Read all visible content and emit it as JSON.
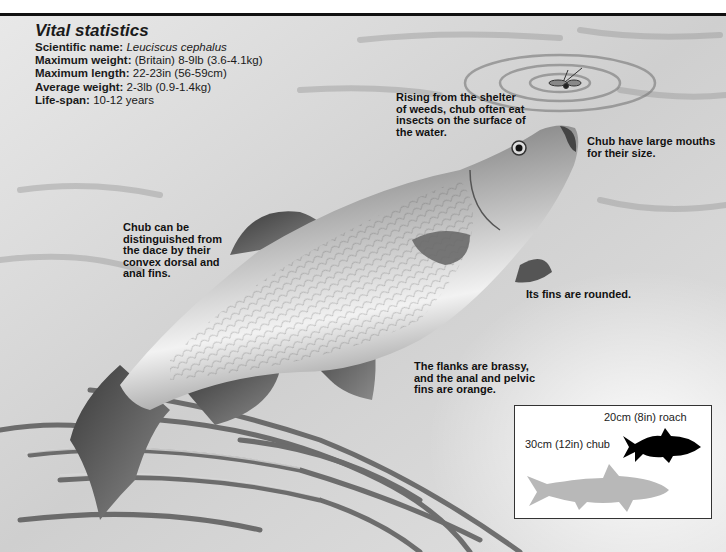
{
  "vital_statistics": {
    "title": "Vital statistics",
    "rows": [
      {
        "label": "Scientific name:",
        "value": "Leuciscus cephalus",
        "italic": true
      },
      {
        "label": "Maximum weight:",
        "value": "(Britain) 8-9lb (3.6-4.1kg)"
      },
      {
        "label": "Maximum length:",
        "value": "22-23in (56-59cm)"
      },
      {
        "label": "Average weight:",
        "value": "2-3lb (0.9-1.4kg)"
      },
      {
        "label": "Life-span:",
        "value": "10-12 years"
      }
    ]
  },
  "annotations": {
    "surface": [
      "Rising from the shelter",
      "of weeds, chub often eat",
      "insects on the surface of",
      "the water."
    ],
    "mouth": [
      "Chub have large mouths",
      "for their size."
    ],
    "fins_dace": [
      "Chub can be",
      "distinguished from",
      "the dace by their",
      "convex dorsal and",
      "anal fins."
    ],
    "rounded": [
      "Its fins are rounded."
    ],
    "flanks": [
      "The flanks are brassy,",
      "and the anal and pelvic",
      "fins are orange."
    ]
  },
  "size_comparison": {
    "roach_label": "20cm (8in) roach",
    "chub_label": "30cm (12in) chub",
    "roach_color": "#000000",
    "chub_color": "#b8b8b8"
  }
}
